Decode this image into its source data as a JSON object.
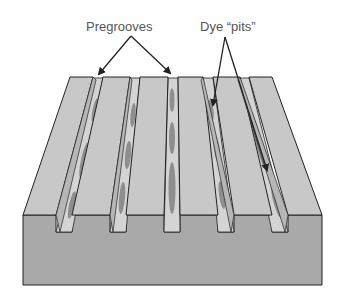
{
  "diagram": {
    "type": "cd-r disc surface cross-section",
    "labels": {
      "pregrooves": "Pregrooves",
      "dye_pits": "Dye “pits”"
    },
    "colors": {
      "background": "#ffffff",
      "top_surface": "#c8c8c8",
      "front_face": "#a9a9a9",
      "groove_floor": "#d2d2d2",
      "groove_wall": "#b8b8b8",
      "pit": "#8c8c8c",
      "outline": "#222222",
      "label_text": "#555555"
    },
    "structure": {
      "ridges": 6,
      "grooves": 5,
      "pits_per_groove_visible": 3
    }
  }
}
